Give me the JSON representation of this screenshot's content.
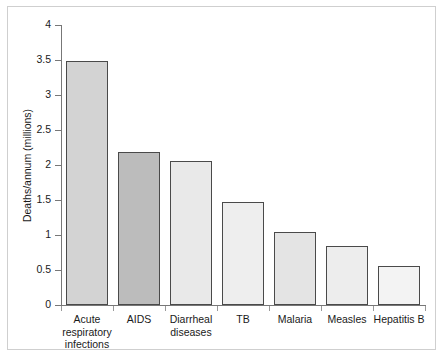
{
  "chart_data": {
    "type": "bar",
    "title": "",
    "xlabel": "",
    "ylabel": "Deaths/annum (millions)",
    "categories": [
      "Acute respiratory infections",
      "AIDS",
      "Diarrheal diseases",
      "TB",
      "Malaria",
      "Measles",
      "Hepatitis B"
    ],
    "category_lines": [
      [
        "Acute",
        "respiratory",
        "infections"
      ],
      [
        "AIDS"
      ],
      [
        "Diarrheal",
        "diseases"
      ],
      [
        "TB"
      ],
      [
        "Malaria"
      ],
      [
        "Measles"
      ],
      [
        "Hepatitis B"
      ]
    ],
    "values": [
      3.49,
      2.19,
      2.06,
      1.47,
      1.05,
      0.84,
      0.56
    ],
    "ylim": [
      0,
      4
    ],
    "ytick_values": [
      0,
      0.5,
      1,
      1.5,
      2,
      2.5,
      3,
      3.5,
      4
    ],
    "ytick_labels": [
      "0",
      "0.5",
      "1",
      "1.5",
      "2",
      "2.5",
      "3",
      "3.5",
      "4"
    ],
    "grid": false,
    "legend": null,
    "bar_colors": [
      "#d3d3d3",
      "#bcbcbc",
      "#e9e9e9",
      "#eeeeee",
      "#e4e4e4",
      "#ededed",
      "#f3f3f3"
    ],
    "bar_edge_color": "#4a4a4a",
    "axis_color": "#777777",
    "background_color": "#ffffff",
    "frame_color": "#cfcfcf"
  }
}
